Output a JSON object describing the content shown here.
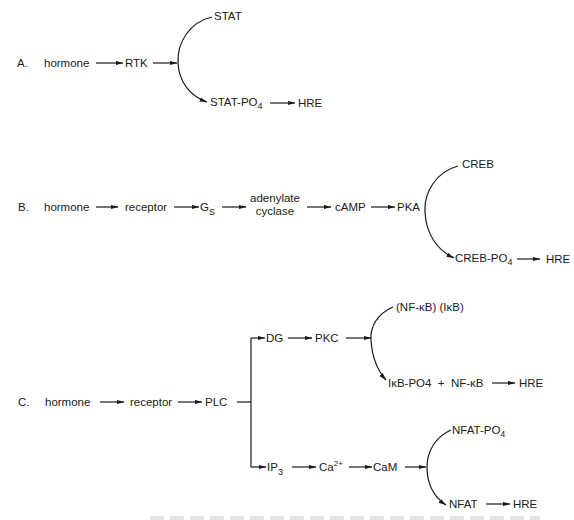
{
  "panels": {
    "A": {
      "label": "A.",
      "hormone": "hormone",
      "rtk": "RTK",
      "stat": "STAT",
      "stat_po4": "STAT-PO",
      "stat_po4_sub": "4",
      "hre": "HRE"
    },
    "B": {
      "label": "B.",
      "hormone": "hormone",
      "receptor": "receptor",
      "gs": "G",
      "gs_sub": "S",
      "adenylate": "adenylate",
      "cyclase": "cyclase",
      "camp": "cAMP",
      "pka": "PKA",
      "creb": "CREB",
      "creb_po4": "CREB-PO",
      "creb_po4_sub": "4",
      "hre": "HRE"
    },
    "C": {
      "label": "C.",
      "hormone": "hormone",
      "receptor": "receptor",
      "plc": "PLC",
      "dg": "DG",
      "pkc": "PKC",
      "nfkb_ikb": "(NF-κB) (IκB)",
      "ikb_po4_nfkb": "IκB-PO4  +  NF-κB",
      "hre1": "HRE",
      "ip3": "IP",
      "ip3_sub": "3",
      "ca": "Ca",
      "ca_sup": "2+",
      "cam": "CaM",
      "nfat_po4": "NFAT-PO",
      "nfat_po4_sub": "4",
      "nfat": "NFAT",
      "hre2": "HRE"
    }
  }
}
